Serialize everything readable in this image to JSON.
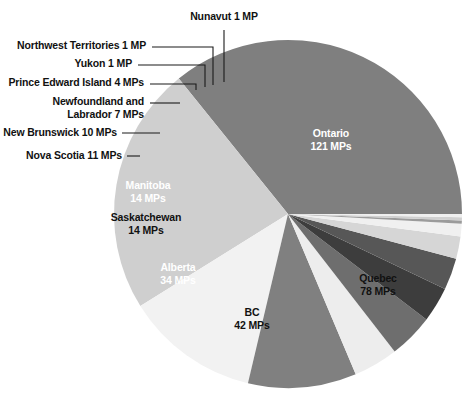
{
  "chart_data": {
    "type": "pie",
    "title": "",
    "subtitle": "",
    "xlabel": "",
    "ylabel": "",
    "legend_position": "none",
    "grid": false,
    "unit_singular": "MP",
    "unit_plural": "MPs",
    "total": 338,
    "categories": [
      "Ontario",
      "Quebec",
      "BC",
      "Alberta",
      "Saskatchewan",
      "Manitoba",
      "Nova Scotia",
      "New Brunswick",
      "Newfoundland and Labrador",
      "Prince Edward Island",
      "Yukon",
      "Northwest Territories",
      "Nunavut"
    ],
    "values": [
      121,
      78,
      42,
      34,
      14,
      14,
      11,
      10,
      7,
      4,
      1,
      1,
      1
    ],
    "colors": [
      "#7f7f7f",
      "#cfcfcf",
      "#f2f2f2",
      "#808080",
      "#ededed",
      "#6e6e6e",
      "#3d3d3d",
      "#575757",
      "#d6d6d6",
      "#f0f0f0",
      "#9b9b9b",
      "#d0d0d0",
      "#efefef"
    ],
    "slices": [
      {
        "name": "Ontario",
        "value": 121,
        "unit": "MPs",
        "color": "#7f7f7f",
        "label_style": "inside-light"
      },
      {
        "name": "Quebec",
        "value": 78,
        "unit": "MPs",
        "color": "#cfcfcf",
        "label_style": "inside-dark"
      },
      {
        "name": "BC",
        "value": 42,
        "unit": "MPs",
        "color": "#f2f2f2",
        "label_style": "inside-dark"
      },
      {
        "name": "Alberta",
        "value": 34,
        "unit": "MPs",
        "color": "#808080",
        "label_style": "inside-light"
      },
      {
        "name": "Saskatchewan",
        "value": 14,
        "unit": "MPs",
        "color": "#ededed",
        "label_style": "inside-dark"
      },
      {
        "name": "Manitoba",
        "value": 14,
        "unit": "MPs",
        "color": "#6e6e6e",
        "label_style": "inside-light"
      },
      {
        "name": "Nova Scotia",
        "value": 11,
        "unit": "MPs",
        "color": "#3d3d3d",
        "label_style": "leader"
      },
      {
        "name": "New Brunswick",
        "value": 10,
        "unit": "MPs",
        "color": "#575757",
        "label_style": "leader"
      },
      {
        "name": "Newfoundland and Labrador",
        "value": 7,
        "unit": "MPs",
        "color": "#d6d6d6",
        "label_style": "leader"
      },
      {
        "name": "Prince Edward Island",
        "value": 4,
        "unit": "MPs",
        "color": "#f0f0f0",
        "label_style": "leader"
      },
      {
        "name": "Yukon",
        "value": 1,
        "unit": "MP",
        "color": "#9b9b9b",
        "label_style": "leader"
      },
      {
        "name": "Northwest Territories",
        "value": 1,
        "unit": "MP",
        "color": "#d0d0d0",
        "label_style": "leader"
      },
      {
        "name": "Nunavut",
        "value": 1,
        "unit": "MP",
        "color": "#efefef",
        "label_style": "leader"
      }
    ]
  },
  "labels": {
    "nunavut": {
      "text": "Nunavut 1 MP"
    },
    "nwt": {
      "text": "Northwest Territories 1 MP"
    },
    "yukon": {
      "text": "Yukon 1 MP"
    },
    "pei": {
      "text": "Prince Edward Island  4 MPs"
    },
    "nl_line1": {
      "text": "Newfoundland and"
    },
    "nl_line2": {
      "text": "Labrador  7 MPs"
    },
    "new_brunswick": {
      "text": "New Brunswick  10 MPs"
    },
    "nova_scotia": {
      "text": "Nova Scotia  11 MPs"
    },
    "manitoba_name": {
      "text": "Manitoba"
    },
    "manitoba_value": {
      "text": "14 MPs"
    },
    "sask_name": {
      "text": "Saskatchewan"
    },
    "sask_value": {
      "text": "14 MPs"
    },
    "alberta_name": {
      "text": "Alberta"
    },
    "alberta_value": {
      "text": "34 MPs"
    },
    "bc_name": {
      "text": "BC"
    },
    "bc_value": {
      "text": "42 MPs"
    },
    "ontario_name": {
      "text": "Ontario"
    },
    "ontario_value": {
      "text": "121 MPs"
    },
    "quebec_name": {
      "text": "Quebec"
    },
    "quebec_value": {
      "text": "78  MPs"
    }
  }
}
